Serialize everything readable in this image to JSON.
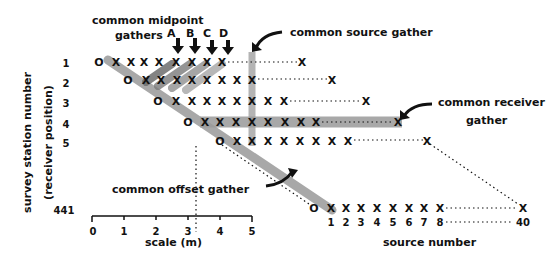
{
  "labels": {
    "cmp_title_line1": "common midpoint",
    "cmp_title_line2": "gathers",
    "cmp_letters": [
      "A",
      "B",
      "C",
      "D"
    ],
    "common_source": "common source gather",
    "common_receiver_line1": "common receiver",
    "common_receiver_line2": "gather",
    "common_offset": "common offset gather",
    "y_axis_line1": "survey station number",
    "y_axis_line2": "(receiver position)",
    "x_axis": "source number",
    "scale_title": "scale (m)"
  },
  "stations": [
    "1",
    "2",
    "3",
    "4",
    "5",
    "441"
  ],
  "source_numbers": [
    "1",
    "2",
    "3",
    "4",
    "5",
    "6",
    "7",
    "8",
    "40"
  ],
  "scale_ticks": [
    "0",
    "1",
    "2",
    "3",
    "4",
    "5"
  ],
  "symbols": {
    "receiver": "O",
    "source": "X"
  },
  "colors": {
    "ink": "#111111",
    "shade": "#9a9a9a",
    "shade_dark": "#6e6e6e",
    "background": "#ffffff"
  }
}
